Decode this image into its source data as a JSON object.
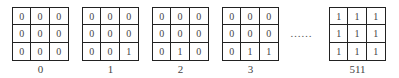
{
  "grids": [
    {
      "label": "0",
      "cells": [
        "0",
        "0",
        "0",
        "0",
        "0",
        "0",
        "0",
        "0",
        "0"
      ]
    },
    {
      "label": "1",
      "cells": [
        "0",
        "0",
        "0",
        "0",
        "0",
        "0",
        "0",
        "0",
        "1"
      ]
    },
    {
      "label": "2",
      "cells": [
        "0",
        "0",
        "0",
        "0",
        "0",
        "0",
        "0",
        "1",
        "0"
      ]
    },
    {
      "label": "3",
      "cells": [
        "0",
        "0",
        "0",
        "0",
        "0",
        "0",
        "0",
        "1",
        "1"
      ]
    },
    {
      "label": "511",
      "cells": [
        "1",
        "1",
        "1",
        "1",
        "1",
        "1",
        "1",
        "1",
        "1"
      ]
    }
  ],
  "ellipsis": "……"
}
